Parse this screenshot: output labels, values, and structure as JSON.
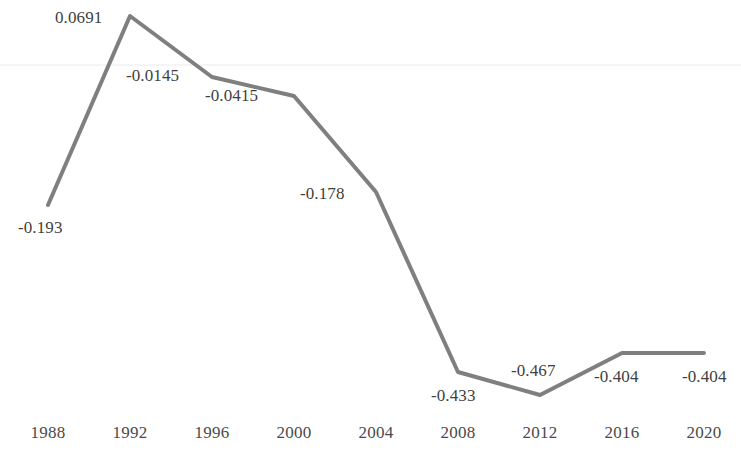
{
  "chart_data": {
    "type": "line",
    "title": "",
    "subtitle": "",
    "xlabel": "",
    "ylabel": "",
    "categories": [
      "1988",
      "1992",
      "1996",
      "2000",
      "2004",
      "2008",
      "2012",
      "2016",
      "2020"
    ],
    "values": [
      -0.193,
      0.0691,
      -0.0145,
      -0.0415,
      -0.178,
      -0.433,
      -0.467,
      -0.404,
      -0.404
    ],
    "value_labels": [
      "-0.193",
      "0.0691",
      "-0.0145",
      "-0.0415",
      "-0.178",
      "-0.433",
      "-0.467",
      "-0.404",
      "-0.404"
    ],
    "series": [
      {
        "name": "",
        "values": [
          -0.193,
          0.0691,
          -0.0145,
          -0.0415,
          -0.178,
          -0.433,
          -0.467,
          -0.404,
          -0.404
        ]
      }
    ],
    "ylim": [
      -0.52,
      0.12
    ],
    "xlim": [
      "1988",
      "2020"
    ],
    "grid": true,
    "gridlines": [
      0
    ],
    "legend": "none",
    "line_color": "#7f7f7f",
    "label_color": "#3f3f3f",
    "axis_label_color": "#4a4a4a",
    "background_color": "#ffffff",
    "gridline_color": "#f2f2f2",
    "line_width": 4,
    "markers": false
  },
  "points": [
    {
      "year": "1988",
      "value": -0.193,
      "label": "-0.193",
      "px": 48,
      "py": 205,
      "lx": 18,
      "ly": 218
    },
    {
      "year": "1992",
      "value": 0.0691,
      "label": "0.0691",
      "px": 130,
      "py": 16,
      "lx": 55,
      "ly": 8
    },
    {
      "year": "1996",
      "value": -0.0145,
      "label": "-0.0145",
      "px": 212,
      "py": 77,
      "lx": 126,
      "ly": 66
    },
    {
      "year": "2000",
      "value": -0.0415,
      "label": "-0.0415",
      "px": 294,
      "py": 96,
      "lx": 205,
      "ly": 86
    },
    {
      "year": "2004",
      "value": -0.178,
      "label": "-0.178",
      "px": 376,
      "py": 192,
      "lx": 300,
      "ly": 184
    },
    {
      "year": "2008",
      "value": -0.433,
      "label": "-0.433",
      "px": 458,
      "py": 372,
      "lx": 431,
      "ly": 386
    },
    {
      "year": "2012",
      "value": -0.467,
      "label": "-0.467",
      "px": 540,
      "py": 395,
      "lx": 511,
      "ly": 361
    },
    {
      "year": "2016",
      "value": -0.404,
      "label": "-0.404",
      "px": 622,
      "py": 353,
      "lx": 594,
      "ly": 367
    },
    {
      "year": "2020",
      "value": -0.404,
      "label": "-0.404",
      "px": 704,
      "py": 353,
      "lx": 682,
      "ly": 367
    }
  ],
  "axis": {
    "ticks": [
      {
        "label": "1988",
        "x": 48
      },
      {
        "label": "1992",
        "x": 130
      },
      {
        "label": "1996",
        "x": 212
      },
      {
        "label": "2000",
        "x": 294
      },
      {
        "label": "2004",
        "x": 376
      },
      {
        "label": "2008",
        "x": 458
      },
      {
        "label": "2012",
        "x": 540
      },
      {
        "label": "2016",
        "x": 622
      },
      {
        "label": "2020",
        "x": 704
      }
    ]
  },
  "gridline": {
    "y": 65
  }
}
